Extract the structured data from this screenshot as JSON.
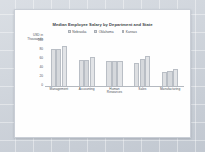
{
  "chart_data": {
    "type": "bar",
    "title": "Median Employee Salary by Department and State",
    "xlabel": "",
    "ylabel": "USD in Thousands",
    "ylabel_lines": [
      "USD in",
      "Thousands"
    ],
    "ylim": [
      0,
      100
    ],
    "yticks": [
      100,
      80,
      60,
      40,
      20,
      0
    ],
    "grid": false,
    "legend_position": "top-center",
    "categories": [
      "Management",
      "Accounting",
      "Human Resources",
      "Sales",
      "Manufacturing"
    ],
    "category_lines": [
      [
        "Management"
      ],
      [
        "Accounting"
      ],
      [
        "Human",
        "Resources"
      ],
      [
        "Sales"
      ],
      [
        "Manufacturing"
      ]
    ],
    "series": [
      {
        "name": "Nebraska",
        "values": [
          82,
          57,
          55,
          50,
          30
        ]
      },
      {
        "name": "Oklahoma",
        "values": [
          82,
          58,
          55,
          60,
          33
        ]
      },
      {
        "name": "Kansas",
        "values": [
          88,
          63,
          55,
          67,
          38
        ]
      }
    ]
  },
  "colors": {
    "desktop": "#ccd2da",
    "card": "#fefefe",
    "card_border": "#c9ced6",
    "series_nebraska": "#dddfe2",
    "series_oklahoma": "#d5d8dc",
    "series_kansas": "#e2e4e7",
    "bar_outline": "#b9bec5",
    "axis": "#b4b9c0",
    "text": "#4a5058",
    "title_text": "#3a3f46"
  }
}
